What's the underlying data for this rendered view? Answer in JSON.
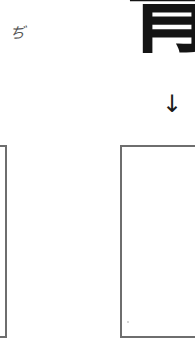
{
  "worksheet": {
    "reading_hint": {
      "text": "ぢ"
    },
    "model_character": {
      "text": "青",
      "visible_portion": "lower part (月 radical) shown; top cropped"
    },
    "direction_arrow": {
      "text": "↓",
      "icon": "arrow-down-icon"
    },
    "answer_boxes": [
      {
        "id": "left",
        "content": ""
      },
      {
        "id": "right",
        "content": ""
      }
    ]
  },
  "colors": {
    "ink": "#141414",
    "box_border": "#6e6e6e",
    "hint_text": "#555555",
    "background": "#ffffff"
  }
}
